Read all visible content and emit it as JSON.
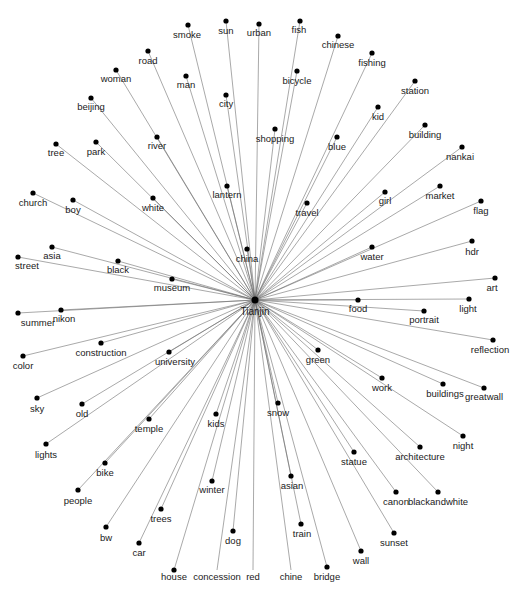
{
  "diagram": {
    "type": "network-graph",
    "layout": "radial-star",
    "center": {
      "id": "Tianjin",
      "label": "Tianjin",
      "x": 255,
      "y": 300,
      "lx": 255,
      "ly": 315
    },
    "colors": {
      "edge": "#6e6e6e",
      "node": "#000000",
      "label": "#1a1a1a",
      "background": "#ffffff"
    },
    "nodes": [
      {
        "label": "smoke",
        "x": 188,
        "y": 25,
        "lx": 187,
        "ly": 38
      },
      {
        "label": "sun",
        "x": 226,
        "y": 21,
        "lx": 226,
        "ly": 34
      },
      {
        "label": "urban",
        "x": 259,
        "y": 24,
        "lx": 259,
        "ly": 36
      },
      {
        "label": "fish",
        "x": 300,
        "y": 21,
        "lx": 299,
        "ly": 33
      },
      {
        "label": "chinese",
        "x": 338,
        "y": 36,
        "lx": 338,
        "ly": 48
      },
      {
        "label": "fishing",
        "x": 372,
        "y": 53,
        "lx": 372,
        "ly": 66
      },
      {
        "label": "station",
        "x": 415,
        "y": 81,
        "lx": 415,
        "ly": 94
      },
      {
        "label": "kid",
        "x": 378,
        "y": 107,
        "lx": 378,
        "ly": 120
      },
      {
        "label": "building",
        "x": 425,
        "y": 125,
        "lx": 425,
        "ly": 138
      },
      {
        "label": "nankai",
        "x": 462,
        "y": 147,
        "lx": 460,
        "ly": 160
      },
      {
        "label": "market",
        "x": 440,
        "y": 186,
        "lx": 440,
        "ly": 199
      },
      {
        "label": "flag",
        "x": 481,
        "y": 201,
        "lx": 481,
        "ly": 214
      },
      {
        "label": "hdr",
        "x": 472,
        "y": 241,
        "lx": 472,
        "ly": 255
      },
      {
        "label": "art",
        "x": 495,
        "y": 278,
        "lx": 492,
        "ly": 291
      },
      {
        "label": "light",
        "x": 469,
        "y": 299,
        "lx": 468,
        "ly": 312
      },
      {
        "label": "portrait",
        "x": 424,
        "y": 311,
        "lx": 424,
        "ly": 323
      },
      {
        "label": "reflection",
        "x": 493,
        "y": 340,
        "lx": 490,
        "ly": 353
      },
      {
        "label": "greatwall",
        "x": 484,
        "y": 388,
        "lx": 484,
        "ly": 400
      },
      {
        "label": "buildings",
        "x": 443,
        "y": 384,
        "lx": 445,
        "ly": 397
      },
      {
        "label": "night",
        "x": 463,
        "y": 436,
        "lx": 463,
        "ly": 449
      },
      {
        "label": "architecture",
        "x": 420,
        "y": 447,
        "lx": 420,
        "ly": 460
      },
      {
        "label": "blackandwhite",
        "x": 438,
        "y": 492,
        "lx": 438,
        "ly": 505
      },
      {
        "label": "canon",
        "x": 396,
        "y": 492,
        "lx": 396,
        "ly": 505
      },
      {
        "label": "sunset",
        "x": 394,
        "y": 533,
        "lx": 394,
        "ly": 546
      },
      {
        "label": "wall",
        "x": 361,
        "y": 551,
        "lx": 361,
        "ly": 564
      },
      {
        "label": "bridge",
        "x": 327,
        "y": 567,
        "lx": 327,
        "ly": 580
      },
      {
        "label": "train",
        "x": 301,
        "y": 524,
        "lx": 302,
        "ly": 537
      },
      {
        "label": "asian",
        "x": 291,
        "y": 476,
        "lx": 292,
        "ly": 489
      },
      {
        "label": "chine",
        "x": 291,
        "y": 570,
        "lx": 291,
        "ly": 580,
        "hidden_dot": true
      },
      {
        "label": "red",
        "x": 253,
        "y": 570,
        "lx": 253,
        "ly": 580,
        "hidden_dot": true
      },
      {
        "label": "concession",
        "x": 217,
        "y": 570,
        "lx": 217,
        "ly": 580,
        "hidden_dot": true
      },
      {
        "label": "house",
        "x": 174,
        "y": 570,
        "lx": 174,
        "ly": 580
      },
      {
        "label": "dog",
        "x": 233,
        "y": 531,
        "lx": 233,
        "ly": 544
      },
      {
        "label": "winter",
        "x": 212,
        "y": 481,
        "lx": 212,
        "ly": 493
      },
      {
        "label": "trees",
        "x": 161,
        "y": 509,
        "lx": 161,
        "ly": 522
      },
      {
        "label": "car",
        "x": 139,
        "y": 543,
        "lx": 139,
        "ly": 556
      },
      {
        "label": "bw",
        "x": 106,
        "y": 527,
        "lx": 106,
        "ly": 541
      },
      {
        "label": "people",
        "x": 78,
        "y": 490,
        "lx": 78,
        "ly": 504
      },
      {
        "label": "bike",
        "x": 105,
        "y": 463,
        "lx": 105,
        "ly": 476
      },
      {
        "label": "lights",
        "x": 46,
        "y": 444,
        "lx": 46,
        "ly": 458
      },
      {
        "label": "temple",
        "x": 149,
        "y": 419,
        "lx": 149,
        "ly": 432
      },
      {
        "label": "old",
        "x": 82,
        "y": 404,
        "lx": 82,
        "ly": 417
      },
      {
        "label": "sky",
        "x": 37,
        "y": 398,
        "lx": 37,
        "ly": 412
      },
      {
        "label": "university",
        "x": 169,
        "y": 352,
        "lx": 175,
        "ly": 365
      },
      {
        "label": "kids",
        "x": 216,
        "y": 414,
        "lx": 216,
        "ly": 427
      },
      {
        "label": "snow",
        "x": 278,
        "y": 403,
        "lx": 278,
        "ly": 416
      },
      {
        "label": "green",
        "x": 318,
        "y": 350,
        "lx": 318,
        "ly": 363
      },
      {
        "label": "work",
        "x": 382,
        "y": 378,
        "lx": 382,
        "ly": 391
      },
      {
        "label": "statue",
        "x": 354,
        "y": 452,
        "lx": 354,
        "ly": 465
      },
      {
        "label": "color",
        "x": 23,
        "y": 356,
        "lx": 23,
        "ly": 369
      },
      {
        "label": "construction",
        "x": 101,
        "y": 343,
        "lx": 101,
        "ly": 356
      },
      {
        "label": "summer",
        "x": 18,
        "y": 313,
        "lx": 38,
        "ly": 326
      },
      {
        "label": "nikon",
        "x": 61,
        "y": 310,
        "lx": 64,
        "ly": 322
      },
      {
        "label": "food",
        "x": 358,
        "y": 300,
        "lx": 358,
        "ly": 312
      },
      {
        "label": "street",
        "x": 18,
        "y": 257,
        "lx": 27,
        "ly": 269
      },
      {
        "label": "asia",
        "x": 52,
        "y": 247,
        "lx": 52,
        "ly": 259
      },
      {
        "label": "black",
        "x": 118,
        "y": 261,
        "lx": 118,
        "ly": 273
      },
      {
        "label": "museum",
        "x": 172,
        "y": 279,
        "lx": 172,
        "ly": 291
      },
      {
        "label": "church",
        "x": 33,
        "y": 193,
        "lx": 33,
        "ly": 206
      },
      {
        "label": "boy",
        "x": 73,
        "y": 200,
        "lx": 73,
        "ly": 213
      },
      {
        "label": "tree",
        "x": 56,
        "y": 144,
        "lx": 56,
        "ly": 156
      },
      {
        "label": "park",
        "x": 96,
        "y": 142,
        "lx": 96,
        "ly": 155
      },
      {
        "label": "white",
        "x": 153,
        "y": 198,
        "lx": 153,
        "ly": 211
      },
      {
        "label": "river",
        "x": 157,
        "y": 137,
        "lx": 157,
        "ly": 149
      },
      {
        "label": "lantern",
        "x": 227,
        "y": 186,
        "lx": 227,
        "ly": 198
      },
      {
        "label": "china",
        "x": 247,
        "y": 249,
        "lx": 247,
        "ly": 262
      },
      {
        "label": "beijing",
        "x": 91,
        "y": 98,
        "lx": 91,
        "ly": 110
      },
      {
        "label": "woman",
        "x": 116,
        "y": 70,
        "lx": 116,
        "ly": 82
      },
      {
        "label": "road",
        "x": 148,
        "y": 51,
        "lx": 148,
        "ly": 64
      },
      {
        "label": "man",
        "x": 186,
        "y": 76,
        "lx": 186,
        "ly": 88
      },
      {
        "label": "city",
        "x": 226,
        "y": 95,
        "lx": 226,
        "ly": 107
      },
      {
        "label": "shopping",
        "x": 275,
        "y": 129,
        "lx": 275,
        "ly": 142
      },
      {
        "label": "bicycle",
        "x": 297,
        "y": 71,
        "lx": 297,
        "ly": 84
      },
      {
        "label": "blue",
        "x": 337,
        "y": 137,
        "lx": 337,
        "ly": 150
      },
      {
        "label": "travel",
        "x": 307,
        "y": 203,
        "lx": 307,
        "ly": 216
      },
      {
        "label": "girl",
        "x": 385,
        "y": 192,
        "lx": 385,
        "ly": 204
      },
      {
        "label": "water",
        "x": 372,
        "y": 247,
        "lx": 372,
        "ly": 260
      }
    ]
  }
}
